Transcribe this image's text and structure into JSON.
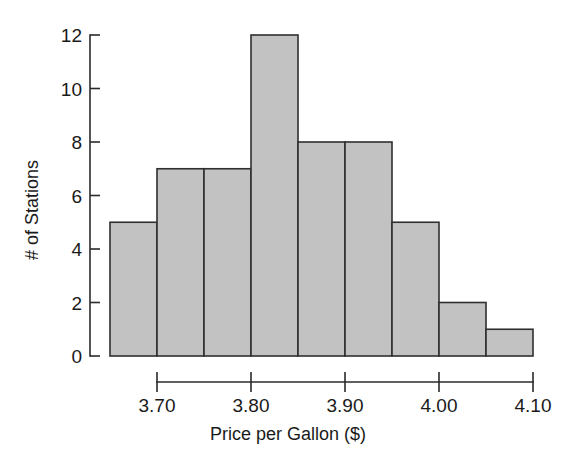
{
  "chart_data": {
    "type": "bar",
    "title": "",
    "subtitle": "",
    "xlabel": "Price per Gallon ($)",
    "ylabel": "# of Stations",
    "categories": [
      "3.65-3.70",
      "3.70-3.75",
      "3.75-3.80",
      "3.80-3.85",
      "3.85-3.90",
      "3.90-3.95",
      "3.95-4.00",
      "4.00-4.05",
      "4.05-4.10"
    ],
    "bin_edges": [
      3.65,
      3.7,
      3.75,
      3.8,
      3.85,
      3.9,
      3.95,
      4.0,
      4.05,
      4.1
    ],
    "bin_width": 0.05,
    "values": [
      5,
      7,
      7,
      12,
      8,
      8,
      5,
      2,
      1
    ],
    "total_count": 55,
    "xlim": [
      3.65,
      4.1
    ],
    "ylim": [
      0,
      12
    ],
    "xticks": [
      3.7,
      3.8,
      3.9,
      4.0,
      4.1
    ],
    "xtick_labels": [
      "3.70",
      "3.80",
      "3.90",
      "4.00",
      "4.10"
    ],
    "yticks": [
      0,
      2,
      4,
      6,
      8,
      10,
      12
    ],
    "ytick_labels": [
      "0",
      "2",
      "4",
      "6",
      "8",
      "10",
      "12"
    ],
    "grid": false,
    "legend": false,
    "legend_position": "none",
    "bar_fill_color": "#c2c2c2",
    "bar_edge_color": "#2f2f2f",
    "axis_color": "#2b2b2b",
    "background_color": "#ffffff"
  }
}
